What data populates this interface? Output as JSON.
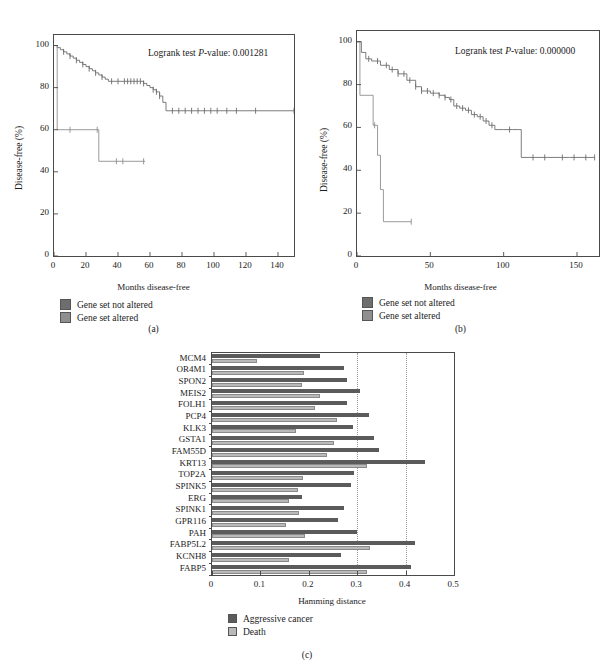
{
  "figure": {
    "panels": [
      "(a)",
      "(b)",
      "(c)"
    ]
  },
  "panel_a": {
    "letter": "(a)",
    "pvalue_prefix": "Logrank test ",
    "pvalue_italic": "P",
    "pvalue_text": "-value: 0.001281",
    "ylabel": "Disease-free (%)",
    "xlabel": "Months disease-free",
    "legend": [
      {
        "label": "Gene set not altered",
        "color": "#6e6e6e"
      },
      {
        "label": "Gene set altered",
        "color": "#8f8f8f"
      }
    ]
  },
  "panel_b": {
    "letter": "(b)",
    "pvalue_prefix": "Logrank test ",
    "pvalue_italic": "P",
    "pvalue_text": "-value: 0.000000",
    "ylabel": "Disease-free (%)",
    "xlabel": "Months disease-free",
    "legend": [
      {
        "label": "Gene set not altered",
        "color": "#6e6e6e"
      },
      {
        "label": "Gene set altered",
        "color": "#8f8f8f"
      }
    ]
  },
  "panel_c": {
    "letter": "(c)",
    "legend": [
      {
        "label": "Aggressive cancer",
        "color": "#5b5b5b"
      },
      {
        "label": "Death",
        "color": "#b9b9b9"
      }
    ]
  },
  "chart_data": [
    {
      "type": "line",
      "title": "",
      "subtitle": "Kaplan-Meier disease-free survival, cohort (a)",
      "xlabel": "Months disease-free",
      "ylabel": "Disease-free (%)",
      "xlim": [
        0,
        150
      ],
      "ylim": [
        0,
        105
      ],
      "xticks": [
        0,
        20,
        40,
        60,
        80,
        100,
        120,
        140
      ],
      "yticks": [
        0,
        20,
        40,
        60,
        80,
        100
      ],
      "grid": false,
      "legend_position": "below",
      "annotation": "Logrank test P-value: 0.001281",
      "series": [
        {
          "name": "Gene set not altered",
          "color": "#6e6e6e",
          "x": [
            0,
            2,
            4,
            6,
            8,
            10,
            12,
            14,
            16,
            18,
            20,
            22,
            24,
            26,
            28,
            30,
            32,
            34,
            44,
            47,
            50,
            53,
            56,
            58,
            60,
            62,
            64,
            66,
            68,
            70,
            100,
            150
          ],
          "y": [
            100,
            99,
            98,
            97,
            96,
            95,
            94,
            93,
            92,
            91,
            90,
            89,
            88,
            87,
            86,
            85,
            84,
            83,
            83,
            83,
            83,
            83,
            82,
            81,
            80,
            79,
            78,
            76,
            73,
            69,
            69,
            69
          ],
          "censor_x": [
            6,
            10,
            14,
            18,
            22,
            26,
            30,
            36,
            40,
            44,
            46,
            48,
            50,
            52,
            54,
            56,
            62,
            64,
            66,
            74,
            78,
            82,
            86,
            90,
            94,
            98,
            102,
            108,
            114,
            126,
            150
          ]
        },
        {
          "name": "Gene set altered",
          "color": "#8f8f8f",
          "x": [
            0,
            2,
            2,
            28,
            28,
            57
          ],
          "y": [
            100,
            100,
            60,
            60,
            45,
            45
          ],
          "censor_x": [
            10,
            27,
            39,
            43,
            56
          ]
        }
      ]
    },
    {
      "type": "line",
      "title": "",
      "subtitle": "Kaplan-Meier disease-free survival, cohort (b)",
      "xlabel": "Months disease-free",
      "ylabel": "Disease-free (%)",
      "xlim": [
        0,
        165
      ],
      "ylim": [
        0,
        105
      ],
      "xticks": [
        0,
        50,
        100,
        150
      ],
      "yticks": [
        0,
        20,
        40,
        60,
        80,
        100
      ],
      "grid": false,
      "legend_position": "below",
      "annotation": "Logrank test P-value: 0.000000",
      "series": [
        {
          "name": "Gene set not altered",
          "color": "#6e6e6e",
          "x": [
            0,
            3,
            6,
            10,
            16,
            22,
            28,
            34,
            40,
            44,
            50,
            56,
            60,
            63,
            66,
            70,
            74,
            78,
            82,
            86,
            90,
            94,
            100,
            106,
            110,
            112,
            118,
            130,
            145,
            162
          ],
          "y": [
            100,
            95,
            92,
            91,
            89,
            87,
            85,
            82,
            79,
            77,
            76,
            75,
            74,
            73,
            70,
            69,
            68,
            66,
            65,
            63,
            61,
            59,
            59,
            59,
            59,
            46,
            46,
            46,
            46,
            46
          ],
          "censor_x": [
            8,
            14,
            20,
            24,
            28,
            32,
            36,
            40,
            44,
            48,
            52,
            56,
            60,
            64,
            68,
            72,
            76,
            80,
            84,
            88,
            92,
            104,
            120,
            128,
            140,
            148,
            156,
            162
          ]
        },
        {
          "name": "Gene set altered",
          "color": "#8f8f8f",
          "x": [
            0,
            2,
            2,
            11,
            11,
            14,
            14,
            16,
            16,
            18,
            18,
            37
          ],
          "y": [
            100,
            100,
            75,
            75,
            61,
            61,
            47,
            47,
            31,
            31,
            16,
            16
          ],
          "censor_x": [
            12,
            37
          ]
        }
      ]
    },
    {
      "type": "bar",
      "orientation": "horizontal",
      "title": "",
      "xlabel": "Hamming distance",
      "ylabel": "",
      "xlim": [
        0,
        0.5
      ],
      "xticks": [
        0,
        0.1,
        0.2,
        0.3,
        0.4,
        0.5
      ],
      "xtick_labels": [
        "0",
        "0.1",
        "0.2",
        "0.3",
        "0.4",
        "0.5"
      ],
      "gridlines_x": [
        0.3,
        0.4
      ],
      "grid": true,
      "legend_position": "below",
      "categories": [
        "MCM4",
        "OR4M1",
        "SPON2",
        "MEIS2",
        "FOLH1",
        "PCP4",
        "KLK3",
        "GSTA1",
        "FAM55D",
        "KRT13",
        "TOP2A",
        "SPINK5",
        "ERG",
        "SPINK1",
        "GPR116",
        "PAH",
        "FABP5L2",
        "KCNH8",
        "FABP5"
      ],
      "series": [
        {
          "name": "Aggressive cancer",
          "color": "#5b5b5b",
          "values": [
            0.224,
            0.272,
            0.279,
            0.305,
            0.279,
            0.325,
            0.291,
            0.334,
            0.346,
            0.44,
            0.293,
            0.288,
            0.186,
            0.273,
            0.26,
            0.3,
            0.419,
            0.267,
            0.412
          ]
        },
        {
          "name": "Death",
          "color": "#b9b9b9",
          "values": [
            0.093,
            0.191,
            0.185,
            0.224,
            0.212,
            0.259,
            0.173,
            0.253,
            0.238,
            0.32,
            0.188,
            0.178,
            0.16,
            0.179,
            0.152,
            0.193,
            0.327,
            0.16,
            0.32
          ]
        }
      ]
    }
  ]
}
